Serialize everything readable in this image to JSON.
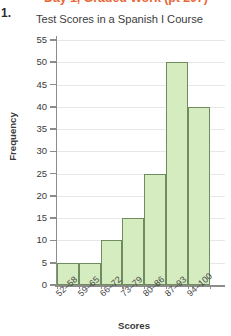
{
  "page": {
    "header_cutoff_text": "Day 1, Graded Work (pt 207)",
    "problem_number": "1."
  },
  "axis": {
    "y_title": "Frequency",
    "x_title": "Scores",
    "y_ticks": [
      "0",
      "5",
      "10",
      "15",
      "20",
      "25",
      "30",
      "35",
      "40",
      "45",
      "50",
      "55"
    ]
  },
  "chart_data": {
    "type": "bar",
    "title": "Test Scores in a Spanish I Course",
    "xlabel": "Scores",
    "ylabel": "Frequency",
    "categories": [
      "52–58",
      "59–65",
      "66–72",
      "73–79",
      "80–86",
      "87–93",
      "94–100"
    ],
    "values": [
      5,
      5,
      10,
      15,
      25,
      50,
      40
    ],
    "ylim": [
      0,
      55
    ],
    "ytick_step": 5,
    "grid": true,
    "legend": "none",
    "bar_fill_color": "#d5ecc0",
    "bar_edge_color": "#6f8c5a",
    "gridline_color": "#e6e6e6",
    "axis_color": "#8c8c8c",
    "histogram": true
  }
}
